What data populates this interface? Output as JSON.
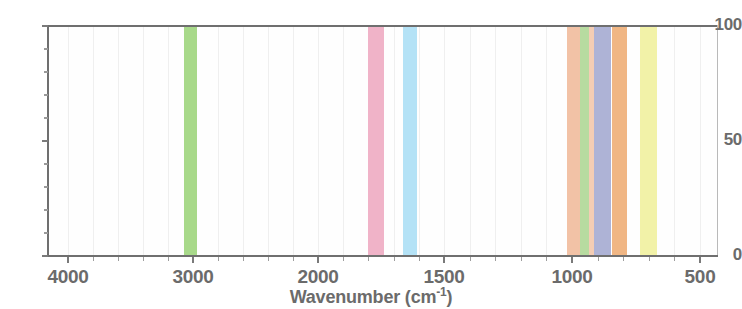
{
  "chart_data": {
    "type": "bar",
    "title": "",
    "subtitle": "",
    "xlabel_text": "Wavenumber (cm",
    "xlabel_sup": "-1",
    "xlabel_tail": ")",
    "xlabel_full": "Wavenumber (cm-1)",
    "ylabel": "",
    "grid": true,
    "legend_position": "top-cropped",
    "xaxis": {
      "reversed": true,
      "scale": "piecewise-linear",
      "range": [
        4000,
        440
      ],
      "ticks": [
        4000,
        3000,
        2000,
        1500,
        1000,
        500
      ],
      "tick_labels": [
        "4000",
        "3000",
        "2000",
        "1500",
        "1000",
        "500"
      ],
      "minor_ticks_per_interval": 5
    },
    "yaxis": {
      "range": [
        0,
        100
      ],
      "ticks": [
        0,
        50,
        100
      ],
      "tick_labels": [
        "0",
        "50",
        "100"
      ],
      "minor_ticks_per_interval": 5
    },
    "bands": [
      {
        "name": "band-ch-stretch",
        "color": "#a8d98a",
        "x_start": 3075,
        "x_end": 2965,
        "height": 100
      },
      {
        "name": "band-carbonyl",
        "color": "#f0b3c8",
        "x_start": 1800,
        "x_end": 1740,
        "height": 100
      },
      {
        "name": "band-amide",
        "color": "#b4e2f6",
        "x_start": 1662,
        "x_end": 1607,
        "height": 100
      },
      {
        "name": "band-fingerprint-a",
        "color": "#f2c2a6",
        "x_start": 1020,
        "x_end": 970,
        "height": 100
      },
      {
        "name": "band-fingerprint-b",
        "color": "#b7dba0",
        "x_start": 970,
        "x_end": 925,
        "height": 100
      },
      {
        "name": "band-fingerprint-c",
        "color": "#f4cdb4",
        "x_start": 932,
        "x_end": 915,
        "height": 100
      },
      {
        "name": "band-fingerprint-d",
        "color": "#aeb3d6",
        "x_start": 916,
        "x_end": 846,
        "height": 100
      },
      {
        "name": "band-fingerprint-e",
        "color": "#f0b684",
        "x_start": 844,
        "x_end": 786,
        "height": 100
      },
      {
        "name": "band-out-of-plane-bend",
        "color": "#f2f2a8",
        "x_start": 735,
        "x_end": 668,
        "height": 100
      }
    ],
    "colors": {
      "axis": "#6f6f6f",
      "tick_label": "#6b6b6b",
      "gridline": "#efefef",
      "plot_background": "#fefefe",
      "page_background": "#ffffff"
    },
    "legend_remnant": [
      "——",
      "—",
      "——"
    ]
  }
}
